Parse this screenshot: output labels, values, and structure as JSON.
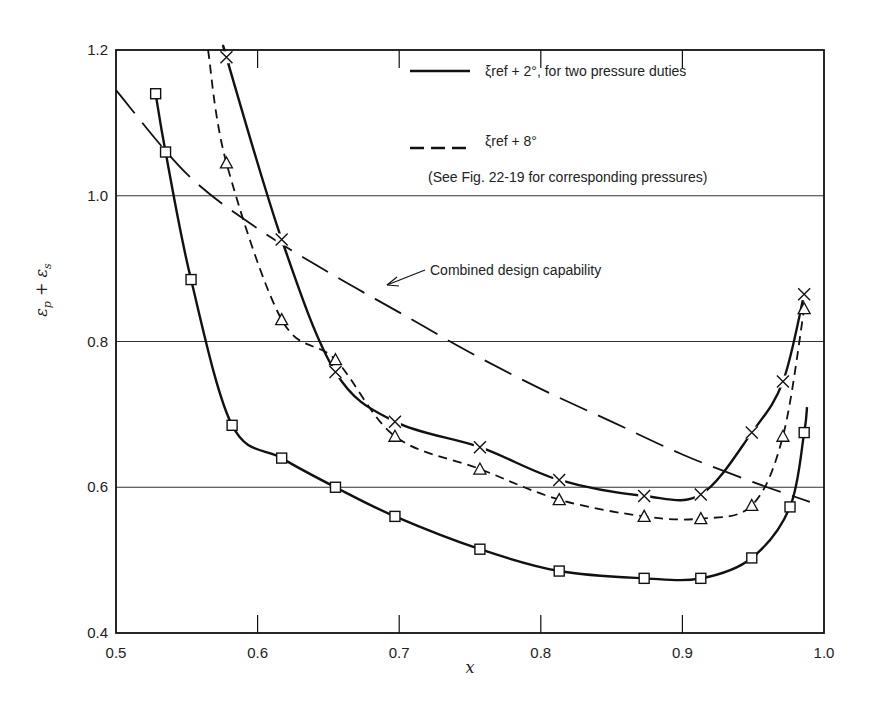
{
  "chart_data": {
    "type": "line",
    "title": "",
    "xlabel": "x",
    "ylabel": "εp + εs",
    "xlim": [
      0.5,
      1.0
    ],
    "ylim": [
      0.4,
      1.2
    ],
    "x_ticks": [
      "0.5",
      "0.6",
      "0.7",
      "0.8",
      "0.9",
      "1.0"
    ],
    "y_ticks": [
      "0.4",
      "0.6",
      "0.8",
      "1.0",
      "1.2"
    ],
    "grid": "horizontal lines at 0.6, 0.8, 1.0",
    "legend_position": "upper right inside plot",
    "legend": [
      {
        "style": "solid",
        "label": "ξref + 2°, for two pressure duties"
      },
      {
        "style": "dashed",
        "label": "ξref + 8°"
      }
    ],
    "legend_note": "(See Fig. 22-19 for corresponding pressures)",
    "annotation": "Combined design capability",
    "series": [
      {
        "name": "ξref + 2° (lower pressure duty)",
        "style": "solid",
        "marker": "square",
        "points": [
          [
            0.528,
            1.14
          ],
          [
            0.535,
            1.06
          ],
          [
            0.553,
            0.885
          ],
          [
            0.582,
            0.685
          ],
          [
            0.617,
            0.64
          ],
          [
            0.655,
            0.6
          ],
          [
            0.697,
            0.56
          ],
          [
            0.757,
            0.515
          ],
          [
            0.813,
            0.485
          ],
          [
            0.873,
            0.475
          ],
          [
            0.913,
            0.475
          ],
          [
            0.949,
            0.503
          ],
          [
            0.976,
            0.573
          ],
          [
            0.986,
            0.675
          ]
        ],
        "curve_end": [
          0.988,
          0.71
        ]
      },
      {
        "name": "ξref + 2° (higher pressure duty)",
        "style": "solid",
        "marker": "x",
        "points": [
          [
            0.578,
            1.19
          ],
          [
            0.617,
            0.94
          ],
          [
            0.655,
            0.758
          ],
          [
            0.697,
            0.69
          ],
          [
            0.757,
            0.655
          ],
          [
            0.813,
            0.61
          ],
          [
            0.873,
            0.588
          ],
          [
            0.913,
            0.59
          ],
          [
            0.949,
            0.675
          ],
          [
            0.971,
            0.745
          ],
          [
            0.986,
            0.865
          ]
        ],
        "curve_start": [
          0.58,
          1.18
        ]
      },
      {
        "name": "ξref + 8°",
        "style": "dashed",
        "marker": "triangle",
        "points": [
          [
            0.578,
            1.045
          ],
          [
            0.617,
            0.83
          ],
          [
            0.655,
            0.775
          ],
          [
            0.697,
            0.67
          ],
          [
            0.757,
            0.625
          ],
          [
            0.813,
            0.583
          ],
          [
            0.873,
            0.56
          ],
          [
            0.913,
            0.557
          ],
          [
            0.949,
            0.575
          ],
          [
            0.971,
            0.67
          ],
          [
            0.986,
            0.845
          ]
        ],
        "curve_start": [
          0.565,
          1.2
        ]
      },
      {
        "name": "Combined design capability",
        "style": "long-dash",
        "marker": "none",
        "points": [
          [
            0.5,
            1.145
          ],
          [
            0.55,
            1.03
          ],
          [
            0.6,
            0.955
          ],
          [
            0.65,
            0.895
          ],
          [
            0.7,
            0.84
          ],
          [
            0.75,
            0.785
          ],
          [
            0.8,
            0.735
          ],
          [
            0.85,
            0.69
          ],
          [
            0.9,
            0.645
          ],
          [
            0.95,
            0.607
          ],
          [
            0.99,
            0.58
          ]
        ]
      }
    ]
  }
}
